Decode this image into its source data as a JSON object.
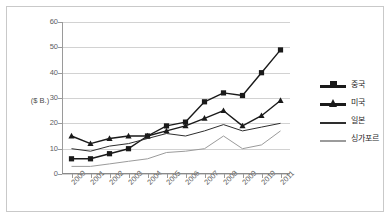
{
  "chart_data": {
    "type": "line",
    "title": "",
    "xlabel": "",
    "ylabel": "($ B.)",
    "ylim": [
      0,
      60
    ],
    "yticks": [
      0,
      10,
      20,
      30,
      40,
      50,
      60
    ],
    "grid": true,
    "legend_position": "right",
    "categories": [
      "2000",
      "2001",
      "2002",
      "2003",
      "2004",
      "2005",
      "2006",
      "2007",
      "2008",
      "2009",
      "2010",
      "2011"
    ],
    "series": [
      {
        "name": "중국",
        "marker": "square",
        "color": "#1a1a1a",
        "values": [
          6,
          6,
          8,
          10,
          15,
          19,
          20.5,
          28.5,
          32,
          31,
          40,
          49
        ]
      },
      {
        "name": "미국",
        "marker": "triangle",
        "color": "#1a1a1a",
        "values": [
          15,
          12,
          14,
          15,
          15,
          17,
          19,
          22,
          25,
          19,
          23,
          29
        ]
      },
      {
        "name": "일본",
        "marker": "none",
        "color": "#2e2e2e",
        "values": [
          10,
          9,
          11,
          12,
          14,
          16,
          15,
          17,
          19.5,
          17,
          18.5,
          20
        ]
      },
      {
        "name": "싱가포르",
        "marker": "none",
        "color": "#9b9b9b",
        "values": [
          3,
          3,
          4,
          5,
          6,
          8.5,
          9,
          10,
          15,
          10,
          11.5,
          17
        ]
      }
    ]
  },
  "legend": {
    "items": [
      {
        "label": "중국",
        "style": "thick-square"
      },
      {
        "label": "미국",
        "style": "thick-triangle"
      },
      {
        "label": "일본",
        "style": "thin-dark"
      },
      {
        "label": "싱가포르",
        "style": "thin-gray"
      }
    ]
  },
  "axis": {
    "y_label": "($ B.)",
    "y_ticks": [
      "0",
      "10",
      "20",
      "30",
      "40",
      "50",
      "60"
    ],
    "x_ticks": [
      "2000",
      "2001",
      "2002",
      "2003",
      "2004",
      "2005",
      "2006",
      "2007",
      "2008",
      "2009",
      "2010",
      "2011"
    ]
  },
  "colors": {
    "grid": "#d2d2d2",
    "axis": "#9a9a9a",
    "frame": "#c9c9c9",
    "series_primary": "#1a1a1a",
    "series_gray": "#9b9b9b"
  }
}
